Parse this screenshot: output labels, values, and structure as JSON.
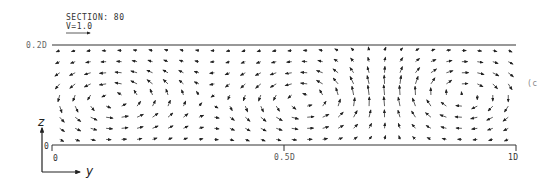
{
  "chart_data": {
    "type": "quiver",
    "title": "SECTION: 80",
    "reference_vector": {
      "label": "V=1.0",
      "length_px": 24
    },
    "xlabel": "y",
    "ylabel": "z",
    "x_ticks": [
      "0",
      "0.5D",
      "1D"
    ],
    "y_ticks": [
      "0",
      "0.2D"
    ],
    "xlim": [
      0,
      1
    ],
    "ylim": [
      0,
      0.2
    ],
    "grid": false,
    "vortices": [
      {
        "center_y": 0.13,
        "center_z": 0.09,
        "rotation": "counterclockwise"
      },
      {
        "center_y": 0.55,
        "center_z": 0.09,
        "rotation": "counterclockwise"
      },
      {
        "center_y": 0.88,
        "center_z": 0.1,
        "rotation": "clockwise"
      }
    ]
  },
  "labels": {
    "section": "SECTION: 80",
    "velocity": "V=1.0",
    "z_top": "0.2D",
    "z_zero": "0",
    "y_zero": "0",
    "y_mid": "0.5D",
    "y_end": "1D",
    "axis_z": "z",
    "axis_y": "y",
    "panel_tag": "(c"
  }
}
